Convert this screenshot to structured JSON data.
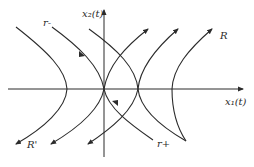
{
  "diagram": {
    "type": "phase-portrait",
    "axes": {
      "x_label": "x₁(t)",
      "y_label": "x₂(t)"
    },
    "labels": {
      "r_minus": "r-",
      "r_plus": "r+",
      "R_top_right": "R",
      "R_bottom_left": "R'"
    },
    "colors": {
      "stroke": "#2b2b2b",
      "background": "#ffffff"
    }
  }
}
